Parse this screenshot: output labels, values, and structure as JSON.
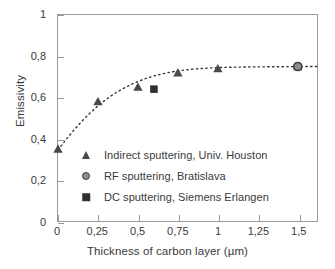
{
  "chart_data": {
    "type": "scatter",
    "title": "",
    "xlabel": "Thickness of carbon layer (µm)",
    "ylabel": "Emissivity",
    "xlim": [
      0,
      1.62
    ],
    "ylim": [
      0,
      1
    ],
    "grid": false,
    "legend_position": "inside lower-left",
    "x_ticks": [
      0,
      0.25,
      0.5,
      0.75,
      1,
      1.25,
      1.5
    ],
    "x_ticklabels": [
      "0",
      "0,25",
      "0,5",
      "0,75",
      "1",
      "1,25",
      "1,5"
    ],
    "y_ticks": [
      0,
      0.2,
      0.4,
      0.6,
      0.8,
      1
    ],
    "y_ticklabels": [
      "0",
      "0,2",
      "0,4",
      "0,6",
      "0,8",
      "1"
    ],
    "series": [
      {
        "name": "Indirect sputtering, Univ. Houston",
        "marker": "triangle",
        "color": "#4a4a4a",
        "points": [
          {
            "x": 0.0,
            "y": 0.35
          },
          {
            "x": 0.25,
            "y": 0.58
          },
          {
            "x": 0.5,
            "y": 0.65
          },
          {
            "x": 0.75,
            "y": 0.72
          },
          {
            "x": 1.0,
            "y": 0.74
          },
          {
            "x": 1.5,
            "y": 0.75
          }
        ]
      },
      {
        "name": "RF sputtering, Bratislava",
        "marker": "circle",
        "color": "#8d8d8d",
        "points": [
          {
            "x": 1.5,
            "y": 0.75
          }
        ]
      },
      {
        "name": "DC sputtering, Siemens Erlangen",
        "marker": "square",
        "color": "#2f2f2f",
        "points": [
          {
            "x": 0.6,
            "y": 0.64
          }
        ]
      }
    ],
    "trend_curve": {
      "style": "dotted",
      "color": "#333333",
      "description": "saturating exponential fit through the data",
      "points": [
        {
          "x": 0.0,
          "y": 0.345
        },
        {
          "x": 0.05,
          "y": 0.395
        },
        {
          "x": 0.1,
          "y": 0.442
        },
        {
          "x": 0.15,
          "y": 0.485
        },
        {
          "x": 0.2,
          "y": 0.524
        },
        {
          "x": 0.25,
          "y": 0.559
        },
        {
          "x": 0.3,
          "y": 0.59
        },
        {
          "x": 0.35,
          "y": 0.617
        },
        {
          "x": 0.4,
          "y": 0.64
        },
        {
          "x": 0.45,
          "y": 0.66
        },
        {
          "x": 0.5,
          "y": 0.677
        },
        {
          "x": 0.55,
          "y": 0.692
        },
        {
          "x": 0.6,
          "y": 0.704
        },
        {
          "x": 0.65,
          "y": 0.714
        },
        {
          "x": 0.7,
          "y": 0.722
        },
        {
          "x": 0.75,
          "y": 0.729
        },
        {
          "x": 0.85,
          "y": 0.738
        },
        {
          "x": 0.95,
          "y": 0.743
        },
        {
          "x": 1.05,
          "y": 0.746
        },
        {
          "x": 1.2,
          "y": 0.748
        },
        {
          "x": 1.4,
          "y": 0.749
        },
        {
          "x": 1.62,
          "y": 0.75
        }
      ]
    }
  },
  "axes": {
    "x_title": "Thickness of carbon layer (µm)",
    "y_title": "Emissivity"
  },
  "legend": {
    "items": [
      {
        "marker": "triangle",
        "label": "Indirect sputtering, Univ. Houston"
      },
      {
        "marker": "circle",
        "label": "RF sputtering, Bratislava"
      },
      {
        "marker": "square",
        "label": "DC sputtering, Siemens Erlangen"
      }
    ]
  },
  "colors": {
    "frame": "#9a9a9a",
    "text": "#3a3a3a",
    "background": "#ffffff",
    "triangle": "#4a4a4a",
    "circle_fill": "#8d8d8d",
    "circle_edge": "#3f3f3f",
    "square": "#2f2f2f",
    "curve": "#333333"
  }
}
